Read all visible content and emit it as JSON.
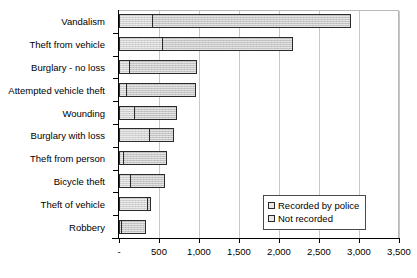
{
  "chart_data": {
    "type": "bar",
    "orientation": "horizontal",
    "stacked": true,
    "title": "",
    "xlabel": "",
    "ylabel": "",
    "xlim": [
      0,
      3500
    ],
    "xtick_values": [
      0,
      500,
      1000,
      1500,
      2000,
      2500,
      3000,
      3500
    ],
    "xtick_labels": [
      "-",
      "500",
      "1,000",
      "1,500",
      "2,000",
      "2,500",
      "3,000",
      "3,500"
    ],
    "grid": true,
    "grid_axis": "x",
    "legend_position": "inside-lower-right",
    "categories": [
      "Vandalism",
      "Theft from vehicle",
      "Burglary - no loss",
      "Attempted vehicle theft",
      "Wounding",
      "Burglary with loss",
      "Theft from person",
      "Bicycle theft",
      "Theft of vehicle",
      "Robbery"
    ],
    "series": [
      {
        "name": "Recorded by police",
        "values": [
          430,
          550,
          140,
          100,
          200,
          390,
          60,
          150,
          365,
          40
        ]
      },
      {
        "name": "Not recorded",
        "values": [
          2470,
          1630,
          835,
          860,
          525,
          300,
          540,
          425,
          35,
          300
        ]
      }
    ],
    "totals": [
      2900,
      2180,
      975,
      960,
      725,
      690,
      600,
      575,
      400,
      340
    ]
  },
  "legend": {
    "items": [
      {
        "label": "Recorded by police",
        "key": "recorded"
      },
      {
        "label": "Not recorded",
        "key": "notrecorded"
      }
    ]
  },
  "colors": {
    "recorded_fill": "#d2d2d2",
    "notrecorded_fill": "#c6c6c6",
    "bar_outline": "#2b2b2b",
    "gridline": "#c8c8c8",
    "axis": "#000000",
    "background": "#ffffff"
  }
}
